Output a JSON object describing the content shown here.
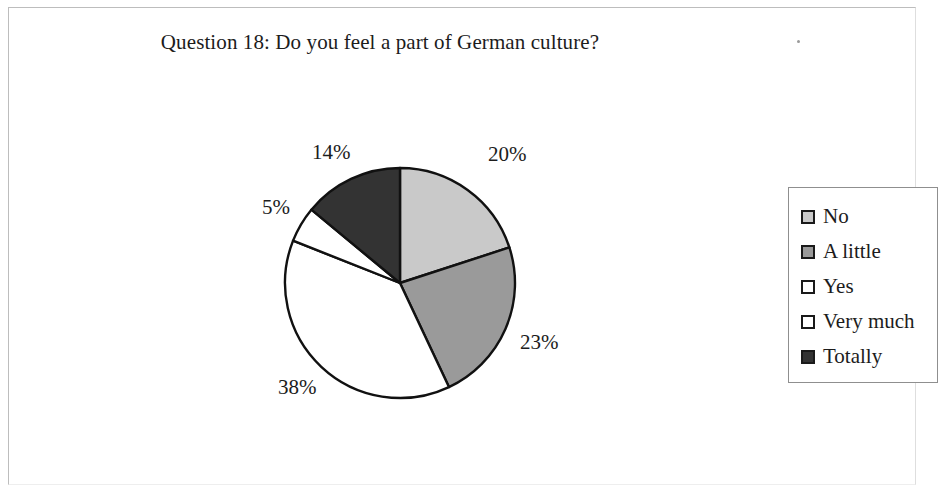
{
  "chart_data": {
    "type": "pie",
    "title": "Question 18: Do you feel a part of German culture?",
    "categories": [
      "No",
      "A little",
      "Yes",
      "Very much",
      "Totally"
    ],
    "values": [
      20,
      23,
      38,
      5,
      14
    ],
    "value_labels": [
      "20%",
      "23%",
      "38%",
      "5%",
      "14%"
    ],
    "colors": [
      "#c9c9c9",
      "#9a9a9a",
      "#ffffff",
      "#ffffff",
      "#333333"
    ],
    "stroke": "#111111",
    "start_angle_deg": 0,
    "direction": "clockwise",
    "legend_position": "right",
    "grid": false,
    "xlabel": "",
    "ylabel": ""
  },
  "title": {
    "text": "Question 18: Do you feel a part of German culture?"
  },
  "slices": [
    {
      "label": "No",
      "percent": "20%",
      "color": "#c9c9c9"
    },
    {
      "label": "A little",
      "percent": "23%",
      "color": "#9a9a9a"
    },
    {
      "label": "Yes",
      "percent": "38%",
      "color": "#ffffff"
    },
    {
      "label": "Very much",
      "percent": "5%",
      "color": "#ffffff"
    },
    {
      "label": "Totally",
      "percent": "14%",
      "color": "#333333"
    }
  ],
  "legend": {
    "items": [
      {
        "label": "No",
        "color": "#c9c9c9"
      },
      {
        "label": "A little",
        "color": "#9a9a9a"
      },
      {
        "label": "Yes",
        "color": "#ffffff"
      },
      {
        "label": "Very much",
        "color": "#ffffff"
      },
      {
        "label": "Totally",
        "color": "#333333"
      }
    ]
  }
}
